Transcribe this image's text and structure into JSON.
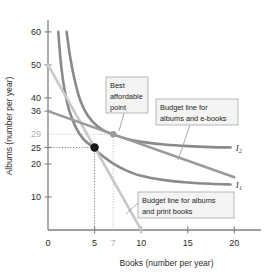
{
  "chart_data": {
    "type": "line",
    "title": "",
    "xlabel": "Books (number per year)",
    "ylabel": "Albums (number per year)",
    "xlim": [
      0,
      22
    ],
    "ylim": [
      0,
      63
    ],
    "grid": false,
    "legend_position": "inline-annotations",
    "xticks": [
      {
        "value": 0,
        "label": "0",
        "muted": false
      },
      {
        "value": 5,
        "label": "5",
        "muted": false
      },
      {
        "value": 7,
        "label": "7",
        "muted": true
      },
      {
        "value": 10,
        "label": "10",
        "muted": false
      },
      {
        "value": 15,
        "label": "15",
        "muted": false
      },
      {
        "value": 20,
        "label": "20",
        "muted": false
      }
    ],
    "yticks": [
      {
        "value": 60,
        "label": "60",
        "muted": false
      },
      {
        "value": 50,
        "label": "50",
        "muted": false
      },
      {
        "value": 40,
        "label": "40",
        "muted": false
      },
      {
        "value": 36,
        "label": "36",
        "muted": false
      },
      {
        "value": 29,
        "label": "29",
        "muted": true
      },
      {
        "value": 25,
        "label": "25",
        "muted": false
      },
      {
        "value": 20,
        "label": "20",
        "muted": false
      },
      {
        "value": 10,
        "label": "10",
        "muted": false
      }
    ],
    "series": [
      {
        "name": "I1",
        "kind": "indifference-curve",
        "label": "I",
        "label_sub": "1",
        "color": "#8a8a8a",
        "points": [
          [
            1.1,
            60
          ],
          [
            1.4,
            50
          ],
          [
            1.8,
            42
          ],
          [
            2.3,
            36
          ],
          [
            3.0,
            31
          ],
          [
            3.8,
            27.5
          ],
          [
            4.6,
            25.6
          ],
          [
            5.6,
            23.0
          ],
          [
            6.8,
            20.5
          ],
          [
            8.2,
            18.3
          ],
          [
            10.0,
            16.4
          ],
          [
            12.5,
            15.1
          ],
          [
            15.0,
            14.4
          ],
          [
            17.5,
            14.0
          ],
          [
            19.6,
            13.8
          ]
        ]
      },
      {
        "name": "I2",
        "kind": "indifference-curve",
        "label": "I",
        "label_sub": "2",
        "color": "#8a8a8a",
        "points": [
          [
            2.0,
            60
          ],
          [
            2.4,
            52
          ],
          [
            2.9,
            45
          ],
          [
            3.5,
            39
          ],
          [
            4.3,
            34.5
          ],
          [
            5.3,
            31.4
          ],
          [
            6.3,
            29.7
          ],
          [
            7.0,
            29.0
          ],
          [
            8.2,
            27.8
          ],
          [
            10.0,
            26.7
          ],
          [
            12.5,
            25.9
          ],
          [
            15.0,
            25.4
          ],
          [
            17.5,
            25.1
          ],
          [
            19.6,
            25.0
          ]
        ]
      },
      {
        "name": "Budget line for albums and print books",
        "kind": "budget-line",
        "color": "#c8c8c8",
        "points": [
          [
            0,
            50
          ],
          [
            10,
            0
          ]
        ]
      },
      {
        "name": "Budget line for albums and e-books",
        "kind": "budget-line",
        "color": "#9a9a9a",
        "points": [
          [
            0,
            36
          ],
          [
            20,
            16
          ]
        ]
      }
    ],
    "points": [
      {
        "name": "best-affordable-point",
        "x": 5,
        "y": 25,
        "color": "#1a1a1a",
        "radius": 4.2,
        "filled": true
      },
      {
        "name": "tangency-point-ebooks",
        "x": 7,
        "y": 29,
        "color": "#9a9a9a",
        "radius": 3.2,
        "filled": true
      }
    ],
    "guide_lines": [
      {
        "name": "guide-y-25",
        "from": [
          0,
          25
        ],
        "to": [
          5,
          25
        ],
        "style": "dotted",
        "color": "#6f6f6f"
      },
      {
        "name": "guide-x-5",
        "from": [
          5,
          25
        ],
        "to": [
          5,
          0
        ],
        "style": "dotted",
        "color": "#6f6f6f"
      },
      {
        "name": "guide-y-29",
        "from": [
          0,
          29
        ],
        "to": [
          7,
          29
        ],
        "style": "dotted",
        "color": "#bdbdbd"
      },
      {
        "name": "guide-x-7",
        "from": [
          7,
          29
        ],
        "to": [
          7,
          0
        ],
        "style": "dotted",
        "color": "#bdbdbd"
      }
    ],
    "annotations": [
      {
        "name": "best-affordable-point",
        "lines": [
          "Best",
          "affordable",
          "point"
        ],
        "box": {
          "x": 106,
          "y": 77,
          "w": 42,
          "h": 36
        },
        "leader": [
          [
            124,
            113
          ],
          [
            119,
            131
          ]
        ]
      },
      {
        "name": "budget-line-ebooks",
        "lines": [
          "Budget line for",
          "albums and e-books"
        ],
        "box": {
          "x": 156,
          "y": 99,
          "w": 82,
          "h": 26
        },
        "leader": [
          [
            190,
            125
          ],
          [
            178,
            160
          ]
        ]
      },
      {
        "name": "budget-line-print-books",
        "lines": [
          "Budget line for albums",
          "and print books"
        ],
        "box": {
          "x": 138,
          "y": 192,
          "w": 96,
          "h": 26
        },
        "leader": [
          [
            140,
            201
          ],
          [
            126,
            214
          ]
        ]
      }
    ]
  }
}
